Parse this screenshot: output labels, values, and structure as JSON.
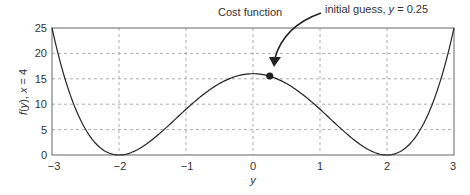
{
  "chart_data": {
    "type": "line",
    "title": "Cost function",
    "xlabel": "y",
    "ylabel": "f(y), x = 4",
    "xlim": [
      -3,
      3
    ],
    "ylim": [
      0,
      25
    ],
    "x_ticks": [
      "−3",
      "−2",
      "−1",
      "0",
      "1",
      "2",
      "3"
    ],
    "y_ticks": [
      "0",
      "5",
      "10",
      "15",
      "20",
      "25"
    ],
    "grid": true,
    "series": [
      {
        "name": "Cost function",
        "x": [
          -3,
          -2.5,
          -2,
          -1.5,
          -1,
          -0.5,
          0,
          0.5,
          1,
          1.5,
          2,
          2.5,
          3
        ],
        "values": [
          25,
          5.06,
          0,
          3.06,
          9,
          14.06,
          16,
          14.06,
          9,
          3.06,
          0,
          5.06,
          25
        ]
      }
    ],
    "annotations": [
      {
        "text": "initial guess, y = 0.25",
        "x": 0.25,
        "y": 15.5,
        "marker": "filled-circle"
      }
    ]
  },
  "labels": {
    "title": "Cost function",
    "annot_prefix": "initial guess, ",
    "annot_var": "y",
    "annot_suffix": " = 0.25",
    "xlabel": "y",
    "ylabel_f": "f",
    "ylabel_rest": "(",
    "ylabel_y": "y",
    "ylabel_tail": "), ",
    "ylabel_x": "x",
    "ylabel_eq": " = 4"
  },
  "ticks": {
    "x": [
      "−3",
      "−2",
      "−1",
      "0",
      "1",
      "2",
      "3"
    ],
    "y": [
      "0",
      "5",
      "10",
      "15",
      "20",
      "25"
    ]
  }
}
